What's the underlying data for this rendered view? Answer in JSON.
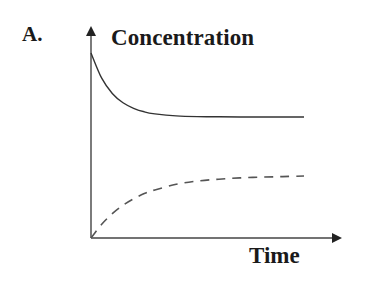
{
  "panel_label": "A.",
  "chart_data": {
    "type": "line",
    "title": "",
    "panel": "A.",
    "xlabel": "Time",
    "ylabel": "Concentration",
    "xlim": [
      0,
      10
    ],
    "ylim": [
      0,
      1.1
    ],
    "grid": false,
    "ticks": false,
    "legend": null,
    "x": [
      0,
      0.5,
      1,
      1.5,
      2,
      2.5,
      3,
      4,
      5,
      6,
      7,
      8,
      9,
      10
    ],
    "series": [
      {
        "name": "solid curve (decaying)",
        "style": "solid",
        "color": "#333333",
        "values": [
          1.0,
          0.864,
          0.781,
          0.731,
          0.701,
          0.682,
          0.671,
          0.66,
          0.656,
          0.655,
          0.654,
          0.654,
          0.654,
          0.654
        ]
      },
      {
        "name": "dashed curve (rising)",
        "style": "dashed",
        "color": "#555555",
        "values": [
          0.0,
          0.074,
          0.132,
          0.177,
          0.212,
          0.24,
          0.26,
          0.29,
          0.308,
          0.318,
          0.325,
          0.329,
          0.332,
          0.335
        ]
      }
    ]
  },
  "axes": {
    "y_label": "Concentration",
    "x_label": "Time"
  }
}
